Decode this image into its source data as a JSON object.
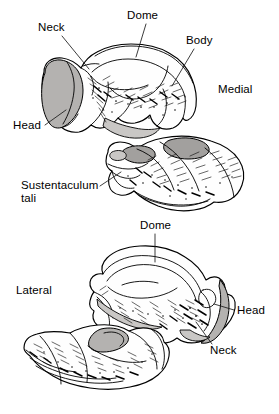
{
  "figure": {
    "background_color": "#ffffff",
    "line_color": "#000000",
    "facet_fill_color": "#b4b2b0",
    "width": 279,
    "height": 414
  },
  "panels": [
    {
      "name": "medial-view",
      "orientation_label": "Medial",
      "bones": [
        "talus",
        "calcaneus"
      ]
    },
    {
      "name": "lateral-view",
      "orientation_label": "Lateral",
      "bones": [
        "talus",
        "calcaneus"
      ]
    }
  ],
  "labels": {
    "medial": {
      "dome": "Dome",
      "neck": "Neck",
      "body": "Body",
      "head": "Head",
      "orientation": "Medial",
      "sustentaculum_line1": "Sustentaculum",
      "sustentaculum_line2": "tali"
    },
    "lateral": {
      "dome": "Dome",
      "orientation": "Lateral",
      "head": "Head",
      "neck": "Neck"
    }
  }
}
